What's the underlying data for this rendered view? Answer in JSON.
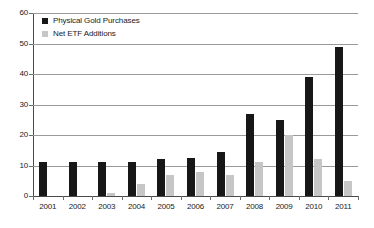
{
  "chart_data": {
    "type": "bar",
    "title": "",
    "subtitle": "",
    "xlabel": "",
    "ylabel": "",
    "ylim": [
      0,
      60
    ],
    "yticks": [
      0,
      10,
      20,
      30,
      40,
      50,
      60
    ],
    "grid": true,
    "legend_position": "top-left",
    "categories": [
      "2001",
      "2002",
      "2003",
      "2004",
      "2005",
      "2006",
      "2007",
      "2008",
      "2009",
      "2010",
      "2011"
    ],
    "series": [
      {
        "name": "Physical Gold Purchases",
        "color": "#171717",
        "values": [
          11,
          11,
          11,
          11,
          12,
          12.5,
          14.5,
          27,
          25,
          39,
          49
        ]
      },
      {
        "name": "Net ETF Additions",
        "color": "#c6c6c6",
        "values": [
          0,
          0,
          1,
          4,
          7,
          8,
          7,
          11,
          20,
          12,
          5
        ]
      }
    ]
  },
  "legend": {
    "items": [
      {
        "label": "Physical Gold Purchases",
        "swatch": "primary"
      },
      {
        "label": "Net ETF Additions",
        "swatch": "secondary"
      }
    ]
  },
  "colors": {
    "primary": "#171717",
    "secondary": "#c6c6c6",
    "grid": "#9a9a9a",
    "axis": "#4a4a4a",
    "text": "#1a1a1a",
    "background": "#ffffff"
  }
}
